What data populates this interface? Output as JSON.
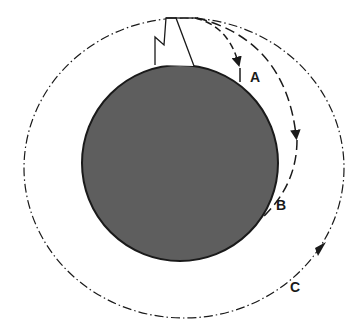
{
  "diagram": {
    "type": "newtons-cannonball-orbits",
    "colors": {
      "planet_fill": "#5e5e5e",
      "planet_stroke": "#1a1a1a",
      "line": "#1a1a1a",
      "background": "#ffffff"
    },
    "trajectories": [
      {
        "id": "A",
        "label": "A",
        "style": "dashed",
        "description": "short fall to surface"
      },
      {
        "id": "B",
        "label": "B",
        "style": "long-dashed",
        "description": "longer fall to surface"
      },
      {
        "id": "C",
        "label": "C",
        "style": "dash-dot",
        "description": "closed orbit"
      }
    ]
  }
}
